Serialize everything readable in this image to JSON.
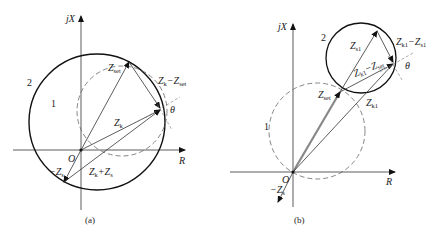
{
  "panel_a": {
    "caption": "(a)",
    "axis_y": "jX",
    "axis_x": "R",
    "origin": "O",
    "circle_1": "1",
    "circle_2": "2",
    "z_set": {
      "main": "Z",
      "sub": "set"
    },
    "zk_minus_zset": {
      "main1": "Z",
      "sub1": "k",
      "sep": "−Z",
      "sub2": "set"
    },
    "zk": {
      "main": "Z",
      "sub": "k"
    },
    "neg_zs": {
      "main": "−Z",
      "sub": "s"
    },
    "zk_plus_zs": {
      "main1": "Z",
      "sub1": "k",
      "sep": "+Z",
      "sub2": "s"
    },
    "theta": "θ"
  },
  "panel_b": {
    "caption": "(b)",
    "axis_y": "jX",
    "axis_x": "R",
    "origin": "O",
    "circle_1": "1",
    "circle_2": "2",
    "z_s1": {
      "main": "Z",
      "sub": "s1"
    },
    "zk1_minus_zs1": {
      "main1": "Z",
      "sub1": "k1",
      "sep": "−Z",
      "sub2": "s1"
    },
    "zk1_minus_zset": {
      "main1": "Z",
      "sub1": "k1",
      "sep": "−Z",
      "sub2": "set"
    },
    "z_set": {
      "main": "Z",
      "sub": "set"
    },
    "zk1": {
      "main": "Z",
      "sub": "k1"
    },
    "neg_zs": {
      "main": "−Z",
      "sub": "s"
    },
    "theta": "θ"
  }
}
